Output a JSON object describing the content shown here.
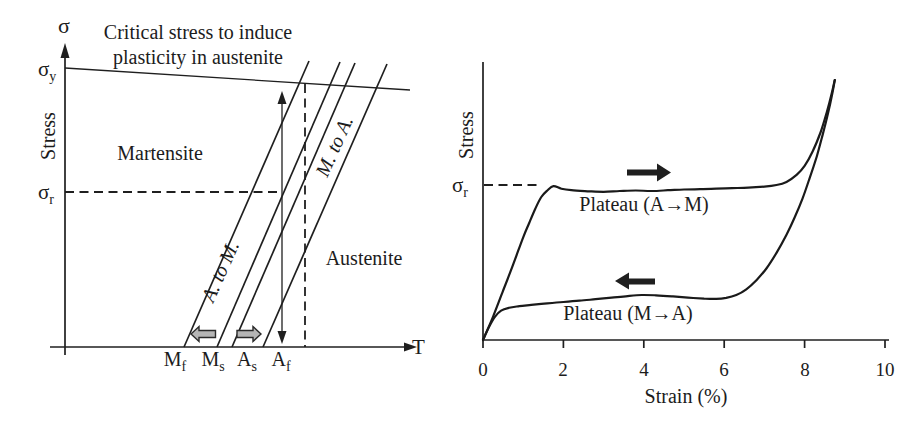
{
  "figure": {
    "background": "#ffffff",
    "ink_color": "#1f1f1f",
    "gray_arrow_color": "#b5b5b5"
  },
  "left_panel": {
    "y_axis_symbol": "σ",
    "y_axis_label": "Stress",
    "x_axis_label": "T",
    "title_line1": "Critical stress to induce",
    "title_line2": "plasticity in austenite",
    "yield_label": {
      "main": "σ",
      "sub": "y"
    },
    "plateau_stress_label": {
      "main": "σ",
      "sub": "r"
    },
    "region_martensite": "Martensite",
    "region_austenite": "Austenite",
    "band_a_to_m": "A. to M.",
    "band_m_to_a": "M. to A.",
    "temp_labels": [
      {
        "main": "M",
        "sub": "f"
      },
      {
        "main": "M",
        "sub": "s"
      },
      {
        "main": "A",
        "sub": "s"
      },
      {
        "main": "A",
        "sub": "f"
      }
    ]
  },
  "right_panel": {
    "y_axis_label": "Stress",
    "plateau_stress_label": {
      "main": "σ",
      "sub": "r"
    },
    "x_axis_label": "Strain (%)",
    "x_ticks": [
      "0",
      "2",
      "4",
      "6",
      "8",
      "10"
    ],
    "upper_plateau_label": "Plateau (A→M)",
    "lower_plateau_label": "Plateau (M→A)"
  },
  "chart_data": [
    {
      "type": "line",
      "title": "Critical stress to induce plasticity in austenite",
      "xlabel": "T",
      "ylabel": "Stress",
      "x_tick_labels": [
        "Mf",
        "Ms",
        "As",
        "Af"
      ],
      "y_tick_labels": [
        "σy",
        "σr"
      ],
      "region_labels": [
        "Martensite",
        "Austenite"
      ],
      "band_labels": [
        "A. to M.",
        "M. to A."
      ],
      "description": "Schematic stress-temperature map: four parallel transformation boundary lines rise from Mf, Ms, As, Af on the T axis; a slightly down-sloping line at σy marks the critical stress to induce plasticity in austenite; dashed guides mark σr and a temperature above Af; a double-headed vertical arrow shows the stress cycling path; small gray arrows on the T axis show boundary shift directions."
    },
    {
      "type": "line",
      "title": "",
      "xlabel": "Strain (%)",
      "ylabel": "Stress",
      "xlim": [
        0,
        10
      ],
      "x_ticks": [
        0,
        2,
        4,
        6,
        8,
        10
      ],
      "ylim": [
        0,
        107
      ],
      "grid": false,
      "legend_position": "none",
      "sigma_r_level": 59.6,
      "annotations": [
        "Plateau (A→M)",
        "Plateau (M→A)"
      ],
      "series": [
        {
          "name": "loading (A to M)",
          "direction": "right",
          "x": [
            0,
            0.25,
            0.5,
            0.75,
            1.0,
            1.15,
            1.3,
            1.45,
            1.6,
            1.75,
            1.95,
            2.2,
            2.6,
            3.0,
            3.4,
            3.8,
            4.2,
            4.6,
            5.0,
            5.4,
            5.8,
            6.2,
            6.6,
            7.0,
            7.3,
            7.55,
            7.8,
            8.0,
            8.2,
            8.4,
            8.55,
            8.67,
            8.75
          ],
          "y": [
            0,
            9,
            19,
            29,
            39.5,
            45,
            50.5,
            55,
            57.5,
            59.2,
            58.2,
            57.6,
            57.2,
            57.0,
            57.3,
            57.5,
            57.3,
            57.6,
            57.9,
            58.0,
            58.2,
            58.4,
            58.6,
            59.0,
            59.6,
            60.8,
            63.5,
            67,
            72.5,
            80,
            87.5,
            94.5,
            100
          ]
        },
        {
          "name": "unloading (M to A)",
          "direction": "left",
          "x": [
            8.75,
            8.68,
            8.58,
            8.45,
            8.3,
            8.12,
            7.95,
            7.75,
            7.55,
            7.3,
            7.05,
            6.8,
            6.55,
            6.3,
            6.05,
            5.8,
            5.5,
            5.1,
            4.7,
            4.3,
            3.95,
            3.6,
            3.2,
            2.8,
            2.4,
            2.0,
            1.6,
            1.2,
            0.9,
            0.65,
            0.45,
            0.3,
            0.15,
            0
          ],
          "y": [
            100,
            94,
            87,
            79,
            70.5,
            62,
            54.5,
            47,
            40.5,
            33.5,
            27.5,
            23,
            19.5,
            17.3,
            16.2,
            15.8,
            15.9,
            16.3,
            16.8,
            17.2,
            17.3,
            16.9,
            16.3,
            15.7,
            15.1,
            14.6,
            14.1,
            13.5,
            13.0,
            12.4,
            11.3,
            9,
            5,
            0
          ]
        }
      ]
    }
  ]
}
